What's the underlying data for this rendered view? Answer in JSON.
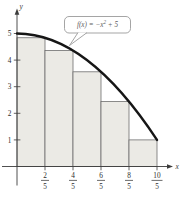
{
  "colors": {
    "background": "#ffffff",
    "fill": "#ebeae5",
    "rect_stroke": "#6e6e6e",
    "axis": "#3c3c3c",
    "curve": "#161616",
    "tick_text": "#2e2e2e",
    "callout_border": "#9b9b9b",
    "callout_text": "#606060"
  },
  "labels": {
    "x_axis": "x",
    "y_axis": "y"
  },
  "callout": {
    "prefix": "f(x) = −x",
    "sup": "2",
    "suffix": " + 5"
  },
  "chart_data": {
    "type": "line",
    "title": "",
    "function": "f(x) = -x^2 + 5",
    "xlabel": "x",
    "ylabel": "y",
    "xlim": [
      0,
      2.35
    ],
    "ylim": [
      0,
      5.8
    ],
    "grid": false,
    "x_range_shown": [
      0,
      2
    ],
    "curve_points": [
      [
        0,
        5
      ],
      [
        0.4,
        4.84
      ],
      [
        0.8,
        4.36
      ],
      [
        1.2,
        3.56
      ],
      [
        1.6,
        2.44
      ],
      [
        2,
        1
      ]
    ],
    "riemann_sum": {
      "method": "right-endpoint",
      "n": 5,
      "dx": 0.4,
      "rectangles": [
        {
          "x0": 0.0,
          "x1": 0.4,
          "height": 4.84
        },
        {
          "x0": 0.4,
          "x1": 0.8,
          "height": 4.36
        },
        {
          "x0": 0.8,
          "x1": 1.2,
          "height": 3.56
        },
        {
          "x0": 1.2,
          "x1": 1.6,
          "height": 2.44
        },
        {
          "x0": 1.6,
          "x1": 2.0,
          "height": 1.0
        }
      ]
    },
    "x_ticks": [
      {
        "numerator": "2",
        "denominator": "5",
        "value": 0.4
      },
      {
        "numerator": "4",
        "denominator": "5",
        "value": 0.8
      },
      {
        "numerator": "6",
        "denominator": "5",
        "value": 1.2
      },
      {
        "numerator": "8",
        "denominator": "5",
        "value": 1.6
      },
      {
        "numerator": "10",
        "denominator": "5",
        "value": 2.0
      }
    ],
    "y_ticks": [
      1,
      2,
      3,
      4,
      5
    ]
  }
}
